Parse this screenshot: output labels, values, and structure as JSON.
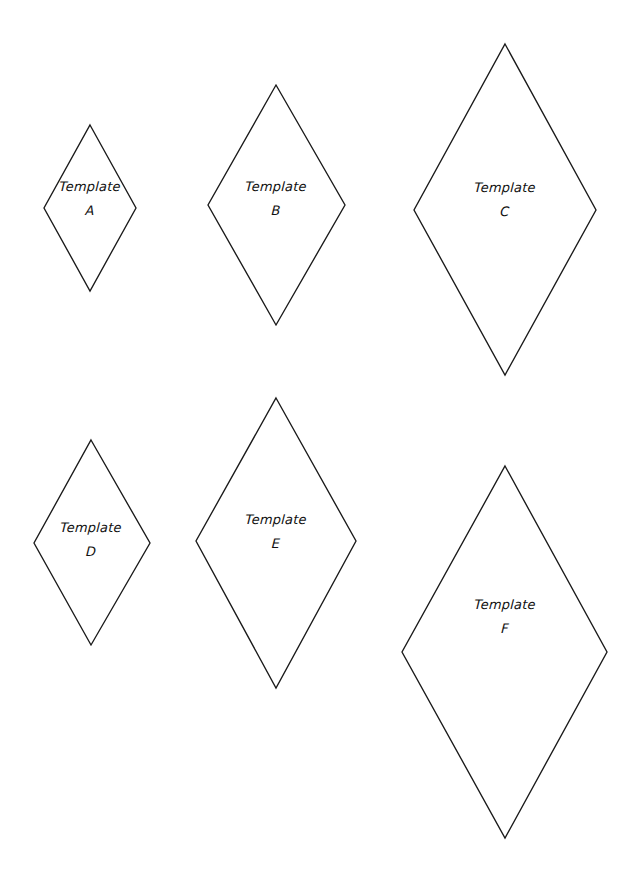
{
  "page": {
    "background_color": "#ffffff",
    "line_color": "#1a1a1a",
    "text_color": "#111111",
    "width": 644,
    "height": 877
  },
  "shapes": [
    {
      "id": "template-a",
      "shape": "rhombus",
      "word": "Template",
      "letter": "A",
      "center_x": 90,
      "top_y": 125,
      "bottom_y": 291,
      "left_x": 44,
      "right_x": 136,
      "side_y": 208,
      "label_x": 90,
      "label_y": 180,
      "width": 92,
      "height": 166
    },
    {
      "id": "template-b",
      "shape": "rhombus",
      "word": "Template",
      "letter": "B",
      "center_x": 276,
      "top_y": 85,
      "bottom_y": 325,
      "left_x": 208,
      "right_x": 345,
      "side_y": 205,
      "label_x": 276,
      "label_y": 180,
      "width": 137,
      "height": 240
    },
    {
      "id": "template-c",
      "shape": "rhombus",
      "word": "Template",
      "letter": "C",
      "center_x": 505,
      "top_y": 44,
      "bottom_y": 375,
      "left_x": 414,
      "right_x": 596,
      "side_y": 210,
      "label_x": 505,
      "label_y": 181,
      "width": 182,
      "height": 331
    },
    {
      "id": "template-d",
      "shape": "rhombus",
      "word": "Template",
      "letter": "D",
      "center_x": 91,
      "top_y": 440,
      "bottom_y": 645,
      "left_x": 34,
      "right_x": 150,
      "side_y": 543,
      "label_x": 91,
      "label_y": 521,
      "width": 116,
      "height": 205
    },
    {
      "id": "template-e",
      "shape": "rhombus",
      "word": "Template",
      "letter": "E",
      "center_x": 276,
      "top_y": 398,
      "bottom_y": 688,
      "left_x": 196,
      "right_x": 356,
      "side_y": 541,
      "label_x": 276,
      "label_y": 513,
      "width": 160,
      "height": 290
    },
    {
      "id": "template-f",
      "shape": "rhombus",
      "word": "Template",
      "letter": "F",
      "center_x": 505,
      "top_y": 466,
      "bottom_y": 838,
      "left_x": 402,
      "right_x": 607,
      "side_y": 652,
      "label_x": 505,
      "label_y": 598,
      "width": 205,
      "height": 372
    }
  ]
}
